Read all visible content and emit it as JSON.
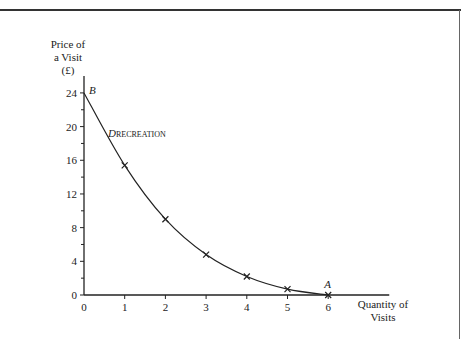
{
  "chart_data": {
    "type": "line",
    "title": "",
    "ylabel": "Price of a Visit (£)",
    "ylabel_lines": [
      "Price of",
      "a Visit",
      "(£)"
    ],
    "xlabel": "Quantity of Visits",
    "xlabel_lines": [
      "Quantity of",
      "Visits"
    ],
    "xlim": [
      0,
      7.5
    ],
    "ylim": [
      0,
      26
    ],
    "x_ticks": [
      0,
      1,
      2,
      3,
      4,
      5,
      6
    ],
    "y_ticks": [
      0,
      4,
      8,
      12,
      16,
      20,
      24
    ],
    "y_minor_ticks": [
      2,
      6,
      10,
      14,
      18,
      22
    ],
    "grid": false,
    "series": [
      {
        "name": "D_RECREATION",
        "label_main": "D",
        "label_sub": "RECREATION",
        "x": [
          0,
          1,
          2,
          3,
          4,
          5,
          6
        ],
        "values": [
          24,
          15.4,
          9,
          4.8,
          2.2,
          0.7,
          0
        ],
        "marker": "x",
        "marked_points_x": [
          1,
          2,
          3,
          4,
          5,
          6
        ]
      }
    ],
    "annotations": [
      {
        "text": "B",
        "x": 0,
        "y": 24
      },
      {
        "text": "A",
        "x": 6,
        "y": 0
      }
    ]
  }
}
